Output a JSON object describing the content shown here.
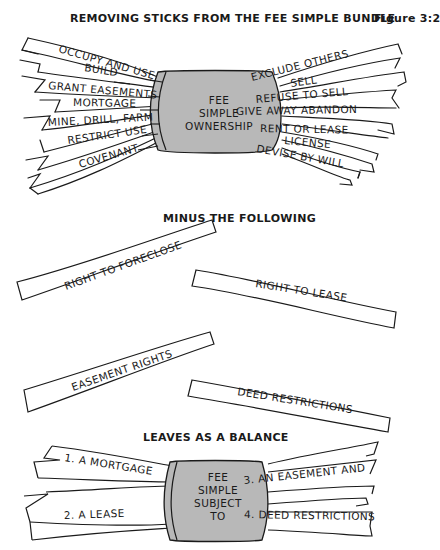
{
  "title": "REMOVING STICKS FROM THE FEE SIMPLE BUNDLE",
  "figure_label": "Figure 3:2",
  "top_bundle": {
    "band_lines": [
      "FEE",
      "SIMPLE",
      "OWNERSHIP"
    ],
    "left_sticks": [
      "OCCUPY AND USE",
      "BUILD",
      "GRANT EASEMENTS",
      "MORTGAGE",
      "MINE, DRILL, FARM",
      "RESTRICT USE",
      "COVENANT"
    ],
    "right_sticks": [
      "EXCLUDE OTHERS",
      "SELL",
      "REFUSE TO SELL",
      "GIVE AWAY  ABANDON",
      "RENT OR LEASE",
      "LICENSE",
      "DEVISE BY WILL"
    ]
  },
  "minus_heading": "MINUS THE FOLLOWING",
  "removed_sticks": [
    "RIGHT TO FORECLOSE",
    "RIGHT TO LEASE",
    "EASEMENT RIGHTS",
    "DEED RESTRICTIONS"
  ],
  "balance_heading": "LEAVES AS A BALANCE",
  "bottom_bundle": {
    "band_lines": [
      "FEE",
      "SIMPLE",
      "SUBJECT",
      "TO"
    ],
    "left_sticks": [
      "1.  A MORTGAGE",
      "2.  A LEASE"
    ],
    "right_sticks": [
      "3.  AN EASEMENT AND",
      "4.  DEED RESTRICTIONS"
    ]
  },
  "colors": {
    "band_fill": "#b8b8b8",
    "ink": "#1a1a1a",
    "paper": "#ffffff"
  }
}
